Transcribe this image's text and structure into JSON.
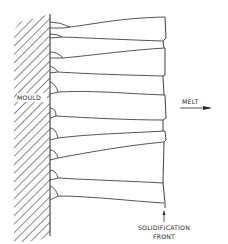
{
  "figure": {
    "type": "schematic",
    "labels": {
      "mould": "MOULD",
      "melt": "MELT",
      "front_line1": "SOLIDIFICATION",
      "front_line2": "FRONT"
    },
    "colors": {
      "line": "#2a2a2a",
      "background": "#ffffff"
    }
  }
}
